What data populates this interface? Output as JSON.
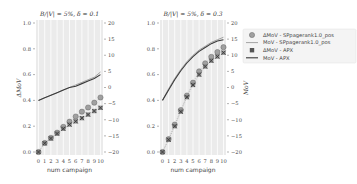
{
  "chart_data": [
    {
      "type": "line",
      "title": "B/|V| = 5%, δ = 0.1",
      "xlabel": "num  campaign",
      "ylabel_left": "ΔMoV",
      "ylabel_right": "MoV",
      "x": [
        0,
        1,
        2,
        3,
        4,
        5,
        6,
        7,
        8,
        9,
        10
      ],
      "xticks": [
        "0",
        "1",
        "2",
        "3",
        "4",
        "5",
        "6",
        "7",
        "8",
        "9",
        "10"
      ],
      "ylim_left": [
        0.0,
        1.0
      ],
      "yticks_left": [
        "0.0",
        "0.2",
        "0.4",
        "0.6",
        "0.8",
        "1.0"
      ],
      "ylim_right": [
        -20,
        20
      ],
      "yticks_right": [
        "−20",
        "−15",
        "−10",
        "−5",
        "0",
        "5",
        "10",
        "15",
        "20"
      ],
      "grid": true,
      "series": [
        {
          "name": "ΔMoV - SPpagerank1.0_pos",
          "axis": "right",
          "marker": "circle",
          "values": [
            -20,
            -17.2,
            -15.6,
            -14.0,
            -12.2,
            -10.6,
            -9.0,
            -7.5,
            -6.2,
            -4.7,
            -3.1
          ]
        },
        {
          "name": "MoV - SPpagerank1.0_pos",
          "axis": "left",
          "style": "light-line",
          "values": [
            0.4,
            0.42,
            0.44,
            0.46,
            0.48,
            0.5,
            0.52,
            0.54,
            0.56,
            0.58,
            0.62
          ]
        },
        {
          "name": "ΔMoV - APX",
          "axis": "right",
          "marker": "x-square",
          "values": [
            -20,
            -17.3,
            -15.8,
            -14.3,
            -12.8,
            -11.5,
            -10.5,
            -9.5,
            -8.4,
            -7.3,
            -6.3
          ]
        },
        {
          "name": "MoV - APX",
          "axis": "left",
          "style": "dark-line",
          "values": [
            0.4,
            0.42,
            0.44,
            0.46,
            0.48,
            0.5,
            0.51,
            0.53,
            0.55,
            0.57,
            0.6
          ]
        }
      ]
    },
    {
      "type": "line",
      "title": "B/|V| = 5%, δ = 0.3",
      "xlabel": "num  campaign",
      "ylabel_left": "ΔMoV",
      "ylabel_right": "MoV",
      "x": [
        0,
        1,
        2,
        3,
        4,
        5,
        6,
        7,
        8,
        9,
        10
      ],
      "xticks": [
        "0",
        "1",
        "2",
        "3",
        "4",
        "5",
        "6",
        "7",
        "8",
        "9",
        "10"
      ],
      "ylim_left": [
        0.0,
        1.0
      ],
      "yticks_left": [
        "0.0",
        "0.2",
        "0.4",
        "0.6",
        "0.8",
        "1.0"
      ],
      "ylim_right": [
        -20,
        20
      ],
      "yticks_right": [
        "−20",
        "−15",
        "−10",
        "−5",
        "0",
        "5",
        "10",
        "15",
        "20"
      ],
      "grid": true,
      "series": [
        {
          "name": "ΔMoV - SPpagerank1.0_pos",
          "axis": "right",
          "marker": "circle",
          "values": [
            -20,
            -16,
            -11.5,
            -7,
            -2.5,
            1.5,
            5,
            7.5,
            9.5,
            11,
            12.5
          ]
        },
        {
          "name": "MoV - SPpagerank1.0_pos",
          "axis": "left",
          "style": "light-line",
          "values": [
            0.4,
            0.49,
            0.57,
            0.64,
            0.7,
            0.75,
            0.79,
            0.82,
            0.85,
            0.87,
            0.89
          ]
        },
        {
          "name": "ΔMoV - APX",
          "axis": "right",
          "marker": "x-square",
          "values": [
            -20,
            -16.2,
            -12,
            -7.5,
            -3,
            0.8,
            4,
            6.5,
            8.3,
            9.6,
            10.8
          ]
        },
        {
          "name": "MoV - APX",
          "axis": "left",
          "style": "dark-line",
          "values": [
            0.4,
            0.48,
            0.56,
            0.63,
            0.69,
            0.74,
            0.78,
            0.81,
            0.84,
            0.86,
            0.87
          ]
        }
      ]
    }
  ],
  "legend": {
    "items": [
      {
        "label": "ΔMoV - SPpagerank1.0_pos",
        "symbol": "circle"
      },
      {
        "label": "MoV - SPpagerank1.0_pos",
        "symbol": "light-line"
      },
      {
        "label": "ΔMoV - APX",
        "symbol": "x-square"
      },
      {
        "label": "MoV - APX",
        "symbol": "dark-line"
      }
    ]
  },
  "colors": {
    "plot_bg": "#ebebeb",
    "grid": "#ffffff",
    "light_line": "#9a9a9a",
    "dark_line": "#3a3a3a",
    "circle_fill": "#a0a0a0",
    "x_marker": "#3a3a3a"
  }
}
